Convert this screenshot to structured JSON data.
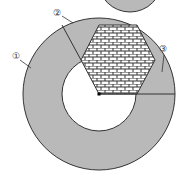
{
  "diagram": {
    "type": "geometry",
    "colors": {
      "ring_fill": "#b9b9b9",
      "stroke": "#333333",
      "hexagon_pattern": "brick",
      "background": "#ffffff"
    },
    "labels": [
      {
        "id": "1",
        "text": "①"
      },
      {
        "id": "2",
        "text": "②"
      },
      {
        "id": "3",
        "text": "③"
      }
    ],
    "center_point": "center-dot"
  }
}
